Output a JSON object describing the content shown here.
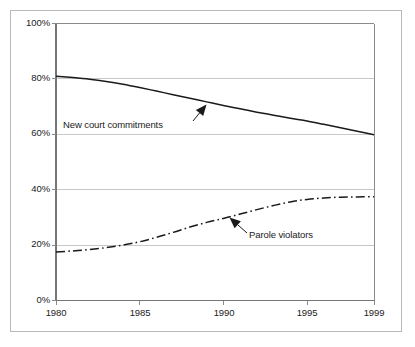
{
  "chart_data": {
    "type": "line",
    "title": "",
    "xlabel": "",
    "ylabel": "",
    "xlim": [
      1980,
      1999
    ],
    "ylim": [
      0,
      100
    ],
    "grid": true,
    "legend_position": "inline-annotations",
    "y_ticks": [
      "0%",
      "20%",
      "40%",
      "60%",
      "80%",
      "100%"
    ],
    "y_tick_values": [
      0,
      20,
      40,
      60,
      80,
      100
    ],
    "x_ticks": [
      "1980",
      "1985",
      "1990",
      "1995",
      "1999"
    ],
    "x_tick_values": [
      1980,
      1985,
      1990,
      1995,
      1999
    ],
    "x": [
      1980,
      1981,
      1982,
      1983,
      1984,
      1985,
      1986,
      1987,
      1988,
      1989,
      1990,
      1991,
      1992,
      1993,
      1994,
      1995,
      1996,
      1997,
      1998,
      1999
    ],
    "series": [
      {
        "name": "New court commitments",
        "style": "solid",
        "color": "#1a1a1a",
        "values": [
          81.0,
          80.5,
          79.9,
          79.1,
          78.1,
          76.9,
          75.6,
          74.3,
          73.0,
          71.7,
          70.4,
          69.2,
          68.0,
          66.9,
          65.8,
          64.8,
          63.6,
          62.4,
          61.1,
          59.8
        ]
      },
      {
        "name": "Parole violators",
        "style": "dash-dot",
        "color": "#1a1a1a",
        "values": [
          17.5,
          17.9,
          18.4,
          19.1,
          20.0,
          21.2,
          22.8,
          24.6,
          26.5,
          28.2,
          29.6,
          31.2,
          32.8,
          34.3,
          35.6,
          36.5,
          37.0,
          37.3,
          37.4,
          37.5
        ]
      }
    ],
    "annotations": [
      {
        "label": "New court commitments",
        "points_to_series": "New court commitments",
        "arrow_direction": "up-right"
      },
      {
        "label": "Parole violators",
        "points_to_series": "Parole violators",
        "arrow_direction": "up-left"
      }
    ]
  },
  "axes": {
    "y_labels": [
      "100%",
      "80%",
      "60%",
      "40%",
      "20%",
      "0%"
    ],
    "x_labels": [
      "1980",
      "1985",
      "1990",
      "1995",
      "1999"
    ]
  },
  "annotations": {
    "new_court_commitments": "New court commitments",
    "parole_violators": "Parole violators"
  },
  "colors": {
    "line": "#1a1a1a",
    "grid": "#c8c8c8",
    "axis": "#8a8a8a",
    "frame": "#b9b9b9",
    "text": "#1b1b1b",
    "background": "#ffffff"
  }
}
